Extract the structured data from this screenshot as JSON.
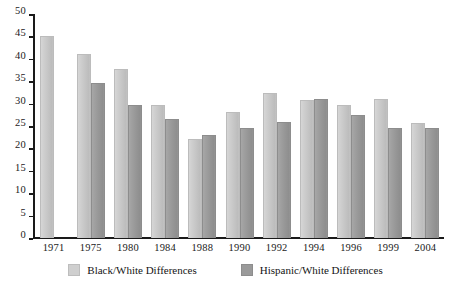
{
  "chart_data": {
    "type": "bar",
    "title": "",
    "subtitle": "",
    "xlabel": "",
    "ylabel": "",
    "ylim": [
      0,
      50
    ],
    "ytick_step": 5,
    "yticks": [
      "50",
      "45",
      "40",
      "35",
      "30",
      "25",
      "20",
      "15",
      "10",
      "5",
      "0"
    ],
    "grid": false,
    "legend_position": "bottom-center",
    "categories": [
      "1971",
      "1975",
      "1980",
      "1984",
      "1988",
      "1990",
      "1992",
      "1994",
      "1996",
      "1999",
      "2004"
    ],
    "series": [
      {
        "name": "Black/White Differences",
        "color": "#cfcfcf",
        "values": [
          45,
          41,
          37.8,
          29.6,
          22.1,
          28.2,
          32.4,
          30.8,
          29.7,
          31,
          25.7
        ]
      },
      {
        "name": "Hispanic/White Differences",
        "color": "#9a9a9a",
        "values": [
          null,
          34.7,
          29.6,
          26.6,
          22.9,
          24.5,
          26,
          31,
          27.4,
          24.5,
          24.6
        ]
      }
    ]
  },
  "legend": {
    "items": [
      {
        "label": "Black/White Differences",
        "swatch": "light"
      },
      {
        "label": "Hispanic/White Differences",
        "swatch": "dark"
      }
    ]
  }
}
